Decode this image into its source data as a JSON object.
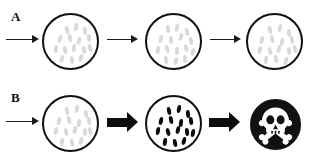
{
  "figure": {
    "width": 311,
    "height": 164,
    "background": "#ffffff",
    "type": "two-row-schematic-diagram"
  },
  "colors": {
    "outline": "#111111",
    "pale_cell": "#d9d9d9",
    "dark_cell": "#0d0d0d",
    "arrow_thin": "#1a1a1a",
    "arrow_block": "#0d0d0d",
    "skull_field": "#111111",
    "skull_mark": "#ffffff"
  },
  "rows": [
    {
      "label": "A",
      "label_pos": {
        "x": 11,
        "y": 10
      },
      "arrows": [
        {
          "name": "arrow-into-a1",
          "style": "thin",
          "x": 6,
          "y": 34,
          "length": 33
        },
        {
          "name": "arrow-a1-to-a2",
          "style": "thin",
          "x": 107,
          "y": 34,
          "length": 31
        },
        {
          "name": "arrow-a2-to-a3",
          "style": "thin",
          "x": 210,
          "y": 34,
          "length": 31
        }
      ],
      "vessels": [
        {
          "name": "vessel-a1",
          "x": 42,
          "y": 13,
          "size": 57,
          "fill": "white",
          "cell_style": "pale",
          "cells": [
            {
              "x": 21,
              "y": 11,
              "rot": -12
            },
            {
              "x": 30,
              "y": 8,
              "rot": 8
            },
            {
              "x": 39,
              "y": 12,
              "rot": -6
            },
            {
              "x": 14,
              "y": 20,
              "rot": 14
            },
            {
              "x": 24,
              "y": 19,
              "rot": -10
            },
            {
              "x": 33,
              "y": 22,
              "rot": 18
            },
            {
              "x": 43,
              "y": 19,
              "rot": -4
            },
            {
              "x": 10,
              "y": 30,
              "rot": 6
            },
            {
              "x": 19,
              "y": 31,
              "rot": -14
            },
            {
              "x": 28,
              "y": 29,
              "rot": 10
            },
            {
              "x": 38,
              "y": 31,
              "rot": -8
            },
            {
              "x": 16,
              "y": 40,
              "rot": 12
            },
            {
              "x": 26,
              "y": 41,
              "rot": -6
            },
            {
              "x": 35,
              "y": 39,
              "rot": 16
            },
            {
              "x": 44,
              "y": 29,
              "rot": -16
            }
          ]
        },
        {
          "name": "vessel-a2",
          "x": 145,
          "y": 13,
          "size": 57,
          "fill": "white",
          "cell_style": "pale",
          "cells": [
            {
              "x": 19,
              "y": 10,
              "rot": -8
            },
            {
              "x": 28,
              "y": 9,
              "rot": 12
            },
            {
              "x": 38,
              "y": 13,
              "rot": -14
            },
            {
              "x": 12,
              "y": 20,
              "rot": 10
            },
            {
              "x": 22,
              "y": 21,
              "rot": -6
            },
            {
              "x": 32,
              "y": 18,
              "rot": 16
            },
            {
              "x": 42,
              "y": 22,
              "rot": -10
            },
            {
              "x": 9,
              "y": 31,
              "rot": 8
            },
            {
              "x": 18,
              "y": 30,
              "rot": -12
            },
            {
              "x": 28,
              "y": 32,
              "rot": 6
            },
            {
              "x": 37,
              "y": 29,
              "rot": -16
            },
            {
              "x": 44,
              "y": 33,
              "rot": 12
            },
            {
              "x": 17,
              "y": 41,
              "rot": -8
            },
            {
              "x": 27,
              "y": 42,
              "rot": 14
            },
            {
              "x": 36,
              "y": 40,
              "rot": -6
            }
          ]
        },
        {
          "name": "vessel-a3",
          "x": 246,
          "y": 13,
          "size": 57,
          "fill": "white",
          "cell_style": "pale",
          "cells": [
            {
              "x": 20,
              "y": 11,
              "rot": -10
            },
            {
              "x": 30,
              "y": 9,
              "rot": 10
            },
            {
              "x": 39,
              "y": 14,
              "rot": -6
            },
            {
              "x": 12,
              "y": 21,
              "rot": 14
            },
            {
              "x": 22,
              "y": 20,
              "rot": -12
            },
            {
              "x": 32,
              "y": 23,
              "rot": 8
            },
            {
              "x": 42,
              "y": 21,
              "rot": -8
            },
            {
              "x": 10,
              "y": 31,
              "rot": 10
            },
            {
              "x": 20,
              "y": 32,
              "rot": -14
            },
            {
              "x": 29,
              "y": 30,
              "rot": 12
            },
            {
              "x": 39,
              "y": 32,
              "rot": -6
            },
            {
              "x": 16,
              "y": 41,
              "rot": 8
            },
            {
              "x": 26,
              "y": 40,
              "rot": -10
            },
            {
              "x": 36,
              "y": 42,
              "rot": 14
            },
            {
              "x": 45,
              "y": 30,
              "rot": -12
            }
          ]
        }
      ]
    },
    {
      "label": "B",
      "label_pos": {
        "x": 11,
        "y": 91
      },
      "arrows": [
        {
          "name": "arrow-into-b1",
          "style": "thin",
          "x": 6,
          "y": 116,
          "length": 33
        },
        {
          "name": "arrow-b1-to-b2",
          "style": "block",
          "x": 107,
          "y": 112,
          "length": 31
        },
        {
          "name": "arrow-b2-to-skull",
          "style": "block",
          "x": 209,
          "y": 112,
          "length": 31
        }
      ],
      "vessels": [
        {
          "name": "vessel-b1",
          "x": 42,
          "y": 95,
          "size": 57,
          "fill": "white",
          "cell_style": "pale",
          "cells": [
            {
              "x": 21,
              "y": 10,
              "rot": -10
            },
            {
              "x": 31,
              "y": 8,
              "rot": 10
            },
            {
              "x": 40,
              "y": 13,
              "rot": -6
            },
            {
              "x": 13,
              "y": 20,
              "rot": 12
            },
            {
              "x": 23,
              "y": 19,
              "rot": -12
            },
            {
              "x": 33,
              "y": 22,
              "rot": 8
            },
            {
              "x": 43,
              "y": 20,
              "rot": -8
            },
            {
              "x": 10,
              "y": 30,
              "rot": 10
            },
            {
              "x": 20,
              "y": 31,
              "rot": -14
            },
            {
              "x": 29,
              "y": 29,
              "rot": 12
            },
            {
              "x": 39,
              "y": 31,
              "rot": -6
            },
            {
              "x": 16,
              "y": 41,
              "rot": 8
            },
            {
              "x": 26,
              "y": 42,
              "rot": -10
            },
            {
              "x": 35,
              "y": 40,
              "rot": 14
            },
            {
              "x": 44,
              "y": 30,
              "rot": -12
            }
          ]
        },
        {
          "name": "vessel-b2",
          "x": 145,
          "y": 95,
          "size": 57,
          "fill": "white",
          "cell_style": "dark",
          "cells": [
            {
              "x": 20,
              "y": 10,
              "rot": -10
            },
            {
              "x": 30,
              "y": 8,
              "rot": 10
            },
            {
              "x": 39,
              "y": 13,
              "rot": -6
            },
            {
              "x": 12,
              "y": 20,
              "rot": 12
            },
            {
              "x": 22,
              "y": 19,
              "rot": -12
            },
            {
              "x": 32,
              "y": 22,
              "rot": 8
            },
            {
              "x": 42,
              "y": 20,
              "rot": -8
            },
            {
              "x": 9,
              "y": 30,
              "rot": 10
            },
            {
              "x": 19,
              "y": 31,
              "rot": -14
            },
            {
              "x": 29,
              "y": 29,
              "rot": 12
            },
            {
              "x": 38,
              "y": 31,
              "rot": -6
            },
            {
              "x": 44,
              "y": 32,
              "rot": 10
            },
            {
              "x": 16,
              "y": 41,
              "rot": 8
            },
            {
              "x": 26,
              "y": 42,
              "rot": -10
            },
            {
              "x": 35,
              "y": 40,
              "rot": 14
            }
          ]
        },
        {
          "name": "vessel-b3-skull",
          "x": 250,
          "y": 99,
          "size": 51,
          "fill": "black",
          "cell_style": "none",
          "symbol": "skull-and-crossbones",
          "cells": []
        }
      ]
    }
  ]
}
